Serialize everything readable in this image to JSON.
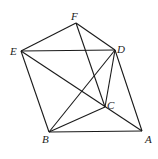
{
  "figure": {
    "points": {
      "A": {
        "label": "A",
        "x": 142,
        "y": 131,
        "lx": 145,
        "ly": 143
      },
      "B": {
        "label": "B",
        "x": 49,
        "y": 132,
        "lx": 42,
        "ly": 143
      },
      "C": {
        "label": "C",
        "x": 105,
        "y": 107,
        "lx": 107,
        "ly": 109
      },
      "D": {
        "label": "D",
        "x": 115,
        "y": 50,
        "lx": 117,
        "ly": 53
      },
      "E": {
        "label": "E",
        "x": 21,
        "y": 51,
        "lx": 10,
        "ly": 55
      },
      "F": {
        "label": "F",
        "x": 76,
        "y": 23,
        "lx": 71,
        "ly": 20
      }
    },
    "edges": [
      [
        "E",
        "F"
      ],
      [
        "F",
        "D"
      ],
      [
        "E",
        "D"
      ],
      [
        "F",
        "C"
      ],
      [
        "E",
        "A"
      ],
      [
        "E",
        "B"
      ],
      [
        "D",
        "B"
      ],
      [
        "D",
        "C"
      ],
      [
        "D",
        "A"
      ],
      [
        "B",
        "C"
      ],
      [
        "B",
        "A"
      ]
    ]
  }
}
